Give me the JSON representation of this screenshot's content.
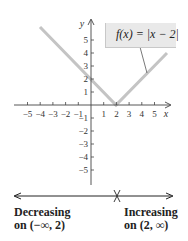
{
  "graph": {
    "function_label": "f(x) = |x − 2|",
    "x_axis_name": "x",
    "y_axis_name": "y",
    "x_ticks": [
      "−5",
      "−4",
      "−3",
      "−2",
      "−1",
      "1",
      "2",
      "3",
      "4",
      "5"
    ],
    "y_ticks": [
      "5",
      "4",
      "3",
      "2",
      "1",
      "−1",
      "−2",
      "−3",
      "−4",
      "−5"
    ],
    "curve_color": "#c4c4c4",
    "vertex": [
      2,
      0
    ],
    "left_endpoint": [
      -4,
      6
    ],
    "right_endpoint": [
      6,
      4
    ]
  },
  "number_line": {
    "mark_at": "2",
    "left_text_line1": "Decreasing",
    "left_text_line2": "on (−∞, 2)",
    "right_text_line1": "Increasing",
    "right_text_line2": "on (2, ∞)"
  }
}
